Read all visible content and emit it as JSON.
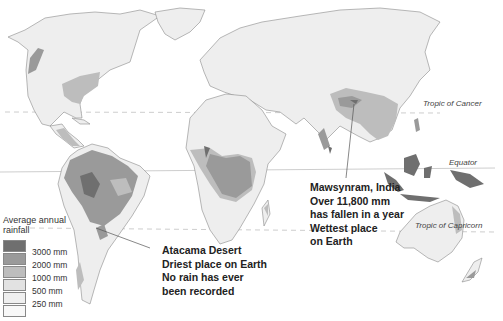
{
  "title_clipped": "",
  "latitude_lines": {
    "tropic_of_cancer": "Tropic of Cancer",
    "equator": "Equator",
    "tropic_of_capricorn": "Tropic of Capricorn"
  },
  "callouts": {
    "atacama": {
      "line1": "Atacama Desert",
      "line2": "Driest place on Earth",
      "line3": "No rain has ever",
      "line4": "been recorded"
    },
    "mawsynram": {
      "line1": "Mawsynram, India",
      "line2": "Over 11,800 mm",
      "line3": "has fallen in a year",
      "line4": "Wettest place",
      "line5": "on Earth"
    }
  },
  "legend": {
    "title_line1": "Average annual",
    "title_line2": "rainfall",
    "items": [
      {
        "label": "3000 mm",
        "color": "#6f6f6f"
      },
      {
        "label": "2000 mm",
        "color": "#9a9a9a"
      },
      {
        "label": "1000 mm",
        "color": "#bdbdbd"
      },
      {
        "label": "500 mm",
        "color": "#e2e2e2"
      },
      {
        "label": "250 mm",
        "color": "#efefef"
      },
      {
        "label": "",
        "color": "#f8f8f8"
      }
    ]
  }
}
